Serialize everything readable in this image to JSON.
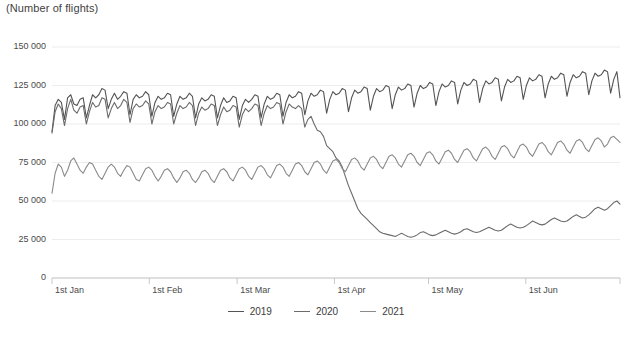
{
  "chart_data": {
    "type": "line",
    "title": "(Number of flights)",
    "xlabel": "",
    "ylabel": "(Number of flights)",
    "ylim": [
      0,
      150000
    ],
    "yticks": [
      0,
      25000,
      50000,
      75000,
      100000,
      125000,
      150000
    ],
    "ytick_labels": [
      "0",
      "25 000",
      "50 000",
      "75 000",
      "100 000",
      "125 000",
      "150 000"
    ],
    "xtick_labels": [
      "1st Jan",
      "1st Feb",
      "1st Mar",
      "1st Apr",
      "1st May",
      "1st Jun"
    ],
    "xtick_days": [
      0,
      31,
      59,
      90,
      120,
      151
    ],
    "x_range_days": [
      0,
      181
    ],
    "grid": "horizontal",
    "legend_position": "bottom-center",
    "colors": {
      "2019": "#545454",
      "2020": "#6b6b6b",
      "2021": "#8a8a8a",
      "gridline": "#ededed",
      "axis": "#c8c8c8",
      "text": "#3c3c3c"
    },
    "series": [
      {
        "name": "2019",
        "color": "#545454",
        "values": [
          95000,
          112000,
          116000,
          114000,
          103000,
          117000,
          119000,
          113000,
          112000,
          116000,
          117000,
          104000,
          112000,
          119000,
          117000,
          119000,
          123000,
          122000,
          110000,
          116000,
          120000,
          116000,
          118000,
          121000,
          120000,
          106000,
          116000,
          119000,
          117000,
          118000,
          121000,
          119000,
          105000,
          114000,
          118000,
          116000,
          117000,
          120000,
          119000,
          105000,
          113000,
          118000,
          116000,
          117000,
          120000,
          118000,
          104000,
          113000,
          117000,
          115000,
          116000,
          119000,
          118000,
          104000,
          112000,
          117000,
          114000,
          115000,
          118000,
          117000,
          103000,
          112000,
          116000,
          114000,
          116000,
          119000,
          118000,
          104000,
          113000,
          118000,
          116000,
          117000,
          120000,
          119000,
          105000,
          114000,
          119000,
          117000,
          118000,
          121000,
          120000,
          106000,
          115000,
          120000,
          118000,
          119000,
          122000,
          121000,
          107000,
          116000,
          121000,
          119000,
          120000,
          123000,
          122000,
          108000,
          117000,
          122000,
          120000,
          121000,
          124000,
          123000,
          109000,
          118000,
          123000,
          121000,
          122000,
          125000,
          124000,
          110000,
          119000,
          124000,
          122000,
          123000,
          126000,
          125000,
          111000,
          120000,
          125000,
          123000,
          124000,
          127000,
          126000,
          112000,
          121000,
          126000,
          124000,
          125000,
          128000,
          127000,
          113000,
          122000,
          127000,
          125000,
          126000,
          129000,
          128000,
          114000,
          123000,
          128000,
          126000,
          127000,
          130000,
          129000,
          115000,
          124000,
          129000,
          127000,
          128000,
          131000,
          130000,
          116000,
          125000,
          130000,
          128000,
          129000,
          132000,
          131000,
          117000,
          126000,
          131000,
          129000,
          130000,
          133000,
          132000,
          118000,
          127000,
          132000,
          130000,
          131000,
          134000,
          133000,
          119000,
          128000,
          133000,
          131000,
          132000,
          135000,
          134000,
          120000,
          129000,
          134000,
          117000
        ]
      },
      {
        "name": "2020",
        "color": "#6b6b6b",
        "values": [
          94000,
          108000,
          113000,
          110000,
          99000,
          110000,
          116000,
          109000,
          107000,
          111000,
          112000,
          100000,
          108000,
          114000,
          111000,
          112000,
          117000,
          116000,
          104000,
          110000,
          114000,
          110000,
          112000,
          116000,
          114000,
          101000,
          110000,
          113000,
          111000,
          112000,
          115000,
          113000,
          100000,
          108000,
          112000,
          110000,
          111000,
          114000,
          113000,
          100000,
          107000,
          112000,
          110000,
          111000,
          114000,
          112000,
          99000,
          107000,
          111000,
          109000,
          110000,
          113000,
          112000,
          99000,
          106000,
          111000,
          108000,
          109000,
          112000,
          111000,
          98000,
          106000,
          110000,
          108000,
          110000,
          113000,
          112000,
          99000,
          107000,
          112000,
          110000,
          111000,
          114000,
          113000,
          100000,
          108000,
          113000,
          111000,
          110000,
          112000,
          110000,
          98000,
          103000,
          105000,
          100000,
          96000,
          95000,
          92000,
          86000,
          84000,
          82000,
          78000,
          76000,
          72000,
          66000,
          60000,
          55000,
          50000,
          45000,
          42000,
          40000,
          38000,
          36000,
          34000,
          32000,
          30000,
          29000,
          28500,
          28000,
          27500,
          27000,
          28000,
          29000,
          28000,
          27000,
          26500,
          27000,
          28000,
          29500,
          30000,
          29000,
          28000,
          27500,
          28000,
          29000,
          30000,
          31000,
          30000,
          29000,
          28500,
          29000,
          30000,
          31500,
          32000,
          31000,
          30000,
          29500,
          30000,
          31000,
          32000,
          33000,
          32000,
          31000,
          30500,
          31000,
          32500,
          34000,
          35000,
          34000,
          33000,
          32500,
          33000,
          34000,
          35500,
          37000,
          36000,
          35000,
          34500,
          35000,
          36500,
          38000,
          39000,
          38000,
          37000,
          36500,
          37000,
          38500,
          40000,
          41000,
          40000,
          39000,
          39500,
          41000,
          43000,
          45000,
          46000,
          45000,
          44000,
          45000,
          47000,
          49000,
          50000,
          48000
        ]
      },
      {
        "name": "2021",
        "color": "#8a8a8a",
        "values": [
          55000,
          68000,
          74000,
          72000,
          66000,
          70000,
          76000,
          78000,
          74000,
          70000,
          68000,
          72000,
          75000,
          74000,
          70000,
          66000,
          64000,
          68000,
          72000,
          74000,
          72000,
          68000,
          66000,
          70000,
          73000,
          72000,
          68000,
          64000,
          63000,
          67000,
          71000,
          72000,
          70000,
          66000,
          63000,
          66000,
          70000,
          71000,
          69000,
          65000,
          62000,
          65000,
          69000,
          70000,
          68000,
          64000,
          62000,
          65000,
          69000,
          70000,
          68000,
          64000,
          62000,
          66000,
          70000,
          71000,
          69000,
          65000,
          63000,
          67000,
          71000,
          72000,
          70000,
          66000,
          64000,
          68000,
          72000,
          73000,
          71000,
          67000,
          65000,
          69000,
          73000,
          74000,
          72000,
          68000,
          66000,
          70000,
          74000,
          75000,
          73000,
          69000,
          67000,
          71000,
          75000,
          76000,
          74000,
          70000,
          68000,
          72000,
          76000,
          77000,
          75000,
          71000,
          69000,
          73000,
          77000,
          78000,
          76000,
          72000,
          70000,
          74000,
          78000,
          79000,
          77000,
          73000,
          71000,
          75000,
          79000,
          80000,
          78000,
          74000,
          72000,
          76000,
          80000,
          81000,
          79000,
          75000,
          73000,
          77000,
          81000,
          82000,
          80000,
          76000,
          74000,
          78000,
          82000,
          83000,
          81000,
          77000,
          75000,
          79000,
          83000,
          84000,
          82000,
          78000,
          76000,
          80000,
          84000,
          85000,
          83000,
          79000,
          77000,
          81000,
          85000,
          86000,
          84000,
          80000,
          78000,
          82000,
          86000,
          87000,
          85000,
          81000,
          79000,
          83000,
          87000,
          88000,
          86000,
          82000,
          80000,
          84000,
          88000,
          89000,
          87000,
          83000,
          81000,
          85000,
          89000,
          90000,
          88000,
          84000,
          82000,
          86000,
          90000,
          91000,
          89000,
          85000,
          87000,
          91000,
          92000,
          90000,
          88000
        ]
      }
    ]
  },
  "legend": {
    "items": [
      {
        "label": "2019"
      },
      {
        "label": "2020"
      },
      {
        "label": "2021"
      }
    ]
  }
}
